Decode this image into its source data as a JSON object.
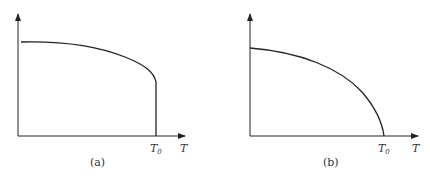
{
  "panels": [
    {
      "id": "a",
      "caption": "(a)",
      "x_axis_label": "T",
      "tick_label_main": "T",
      "tick_label_sub": "0",
      "curve_description": "gradual decline then vertical drop at T0"
    },
    {
      "id": "b",
      "caption": "(b)",
      "x_axis_label": "T",
      "tick_label_main": "T",
      "tick_label_sub": "0",
      "curve_description": "smooth concave decline reaching zero at T0"
    }
  ],
  "colors": {
    "line": "#222222",
    "text": "#333333"
  }
}
